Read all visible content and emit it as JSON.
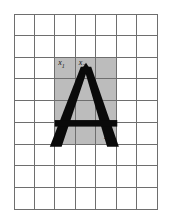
{
  "figure": {
    "type": "grid-with-glyph",
    "background_color": "#ffffff"
  },
  "grid": {
    "columns": 7,
    "rows": 9,
    "line_color": "#6e6e6e",
    "cell_fill_default": "#ffffff",
    "cell_fill_shaded": "#bcbcbc",
    "shaded_region": {
      "col_start": 3,
      "col_end": 5,
      "row_start": 3,
      "row_end": 6,
      "cols": 3,
      "rows": 4
    }
  },
  "glyph": {
    "character": "A",
    "color": "#0a0a0a",
    "style": "bold-serifless-triangular"
  },
  "labels": [
    {
      "id": "label-x1",
      "text": "x",
      "subscript": "1",
      "col": 3,
      "row": 3,
      "position": "top-left"
    },
    {
      "id": "label-x2",
      "text": "x",
      "subscript": "2",
      "col": 4,
      "row": 3,
      "position": "top-left"
    },
    {
      "id": "label-x12",
      "text": "x",
      "subscript": "12",
      "col": 5,
      "row": 6,
      "position": "bottom-right"
    }
  ]
}
